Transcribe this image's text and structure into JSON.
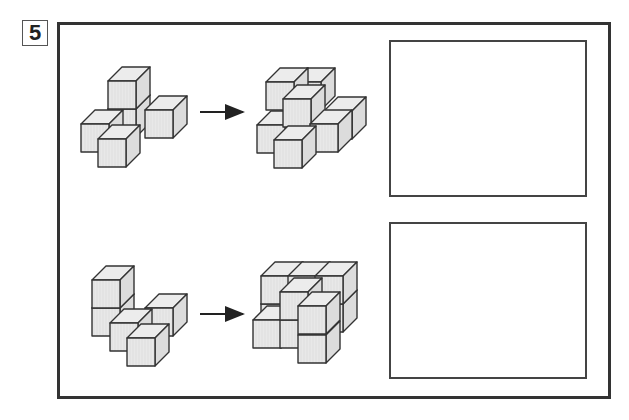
{
  "problem": {
    "number": "5"
  },
  "style": {
    "cube_fill_front": "#e9e9e9",
    "cube_fill_top": "#ececec",
    "cube_fill_side": "#dcdcdc",
    "stroke": "#333333",
    "frame_color": "#333333"
  },
  "cube": {
    "size": 28,
    "depth_dx": 14,
    "depth_dy": -14
  },
  "rows": [
    {
      "id": "row-1",
      "before": {
        "cubes": [
          [
            108,
            109
          ],
          [
            108,
            81
          ],
          [
            145,
            110
          ],
          [
            81,
            124
          ],
          [
            98,
            139
          ]
        ]
      },
      "arrow": {
        "x1": 200,
        "x2": 243,
        "y": 112
      },
      "after": {
        "cubes": [
          [
            293,
            82
          ],
          [
            266,
            82
          ],
          [
            324,
            111
          ],
          [
            257,
            125
          ],
          [
            283,
            99
          ],
          [
            310,
            124
          ],
          [
            274,
            140
          ]
        ]
      },
      "answer_box": {
        "x": 389,
        "y": 40,
        "w": 198,
        "h": 157
      }
    },
    {
      "id": "row-2",
      "before": {
        "cubes": [
          [
            92,
            308
          ],
          [
            92,
            280
          ],
          [
            145,
            308
          ],
          [
            110,
            323
          ],
          [
            127,
            338
          ]
        ]
      },
      "arrow": {
        "x1": 200,
        "x2": 243,
        "y": 314
      },
      "after": {
        "cubes": [
          [
            315,
            304
          ],
          [
            261,
            304
          ],
          [
            288,
            304
          ],
          [
            261,
            276
          ],
          [
            288,
            276
          ],
          [
            315,
            276
          ],
          [
            253,
            320
          ],
          [
            280,
            320
          ],
          [
            280,
            292
          ],
          [
            298,
            335
          ],
          [
            298,
            306
          ]
        ]
      },
      "answer_box": {
        "x": 389,
        "y": 222,
        "w": 198,
        "h": 157
      }
    }
  ]
}
